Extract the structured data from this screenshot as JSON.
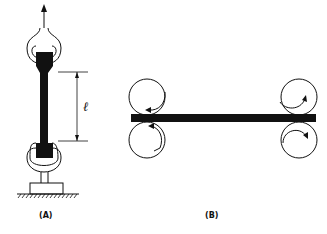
{
  "figure": {
    "panel_a": {
      "label": "(A)",
      "description": "Tensile test specimen held in grips, pulled upward",
      "length_symbol": "ℓ"
    },
    "panel_b": {
      "label": "(B)",
      "description": "Strip passing between two pairs of rollers rotating in opposite senses"
    },
    "colors": {
      "ink": "#111111",
      "background": "#ffffff"
    }
  }
}
